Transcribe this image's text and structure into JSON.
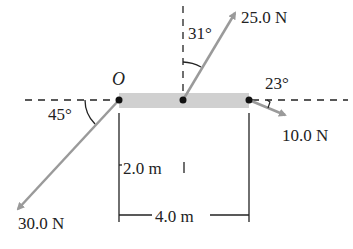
{
  "diagram": {
    "type": "free-body force diagram on a bar",
    "origin_label": "O",
    "forces": [
      {
        "id": "f1",
        "magnitude_label": "25.0 N",
        "angle_label": "31°",
        "reference": "vertical",
        "point": "middle"
      },
      {
        "id": "f2",
        "magnitude_label": "10.0 N",
        "angle_label": "23°",
        "reference": "horizontal",
        "point": "right end"
      },
      {
        "id": "f3",
        "magnitude_label": "30.0 N",
        "angle_label": "45°",
        "reference": "horizontal",
        "point": "O (left end)"
      }
    ],
    "dimensions": [
      {
        "id": "d1",
        "label": "2.0 m"
      },
      {
        "id": "d2",
        "label": "4.0 m"
      }
    ],
    "colors": {
      "bar": "#cfcfcf",
      "arrow": "#9a9a9a",
      "line": "#222222"
    }
  }
}
